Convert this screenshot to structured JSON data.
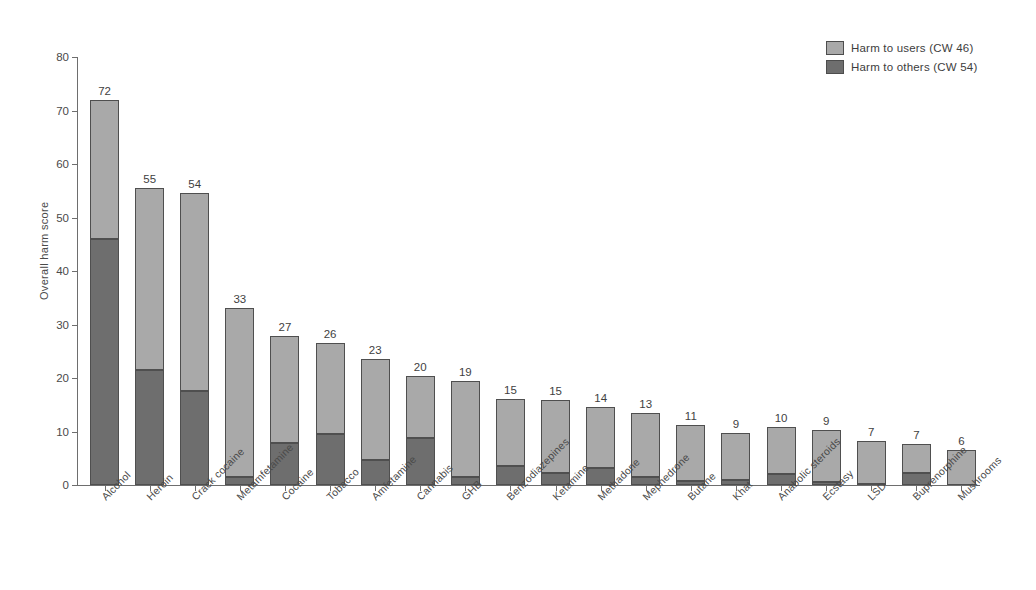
{
  "chart_data": {
    "type": "bar",
    "title": "",
    "subtitle": "",
    "xlabel": "",
    "ylabel": "Overall harm score",
    "ylim": [
      0,
      80
    ],
    "yticks": [
      0,
      10,
      20,
      30,
      40,
      50,
      60,
      70,
      80
    ],
    "grid": false,
    "stacked": true,
    "legend_position": "top-right",
    "categories": [
      "Alcohol",
      "Heroin",
      "Crack cocaine",
      "Metamfetamine",
      "Cocaine",
      "Tobacco",
      "Amfetamine",
      "Cannabis",
      "GHB",
      "Benzodiazepines",
      "Ketamine",
      "Methadone",
      "Mephedrone",
      "Butane",
      "Khat",
      "Anabolic steroids",
      "Ecstasy",
      "LSD",
      "Buprenorphine",
      "Mushrooms"
    ],
    "series": [
      {
        "name": "Harm to users (CW 46)",
        "color": "#a9a9a9",
        "values": [
          26,
          34,
          37,
          31.5,
          20,
          17,
          19,
          11.5,
          18,
          12.5,
          13.5,
          11.5,
          12,
          10.5,
          8.8,
          8.8,
          9.7,
          8,
          5.5,
          6.5
        ]
      },
      {
        "name": "Harm to others (CW 54)",
        "color": "#6e6e6e",
        "values": [
          46,
          21.5,
          17.5,
          1.5,
          7.8,
          9.6,
          4.6,
          8.8,
          1.5,
          3.5,
          2.3,
          3.1,
          1.5,
          0.8,
          0.9,
          2,
          0.6,
          0.2,
          2.2,
          0
        ]
      }
    ],
    "totals": [
      72,
      55,
      54,
      33,
      27,
      26,
      23,
      20,
      19,
      15,
      15,
      14,
      13,
      11,
      9,
      10,
      9,
      7,
      7,
      6
    ],
    "value_labels": [
      "72",
      "55",
      "54",
      "33",
      "27",
      "26",
      "23",
      "20",
      "19",
      "15",
      "15",
      "14",
      "13",
      "11",
      "9",
      "10",
      "9",
      "7",
      "7",
      "6"
    ]
  },
  "legend": {
    "items": [
      {
        "label": "Harm to users (CW 46)",
        "color": "#a9a9a9"
      },
      {
        "label": "Harm to others (CW 54)",
        "color": "#6e6e6e"
      }
    ]
  },
  "axis": {
    "y_title": "Overall harm score",
    "y_ticks": [
      "0",
      "10",
      "20",
      "30",
      "40",
      "50",
      "60",
      "70",
      "80"
    ]
  }
}
